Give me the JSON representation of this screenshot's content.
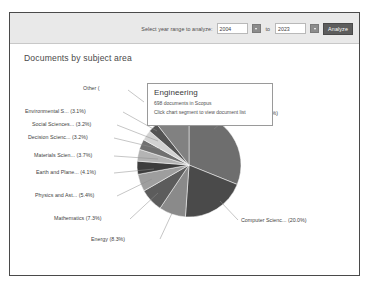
{
  "toolbar": {
    "year_range_label": "Select year range to analyze:",
    "start_year": "2004",
    "end_year": "2023",
    "to_label": "to",
    "analyze_label": "Analyze",
    "start_dropdown_icon": "chevron-down-icon",
    "end_dropdown_icon": "chevron-down-icon"
  },
  "chart_title": "Documents by subject area",
  "tooltip": {
    "title": "Engineering",
    "count_text": "698 documents in Scopus",
    "hint_text": "Click chart segment to view document list"
  },
  "chart_data": {
    "type": "pie",
    "title": "Documents by subject area",
    "legend_position": "none",
    "labels_style": "leader-line callouts",
    "categories": [
      "Engineering (31.1%)",
      "Computer Scienc... (20.0%)",
      "Energy (8.3%)",
      "Mathematics (7.3%)",
      "Physics and Ast... (5.4%)",
      "Earth and Plane... (4.1%)",
      "Materials Scien... (3.7%)",
      "Decision Scienc... (3.2%)",
      "Social Sciences... (3.2%)",
      "Environmental S... (3.1%)",
      "Other (...)"
    ],
    "values": [
      31.1,
      20.0,
      8.3,
      7.3,
      5.4,
      4.1,
      3.7,
      3.2,
      3.2,
      3.1,
      10.6
    ],
    "unit": "%",
    "colors": [
      "#6e6e6e",
      "#4a4a4a",
      "#8a8a8a",
      "#5c5c5c",
      "#9e9e9e",
      "#3d3d3d",
      "#b4b4b4",
      "#707070",
      "#d2d2d2",
      "#545454",
      "#818181"
    ]
  },
  "slice_labels": [
    {
      "text": "Other (",
      "side": "left"
    },
    {
      "text": "Environmental S... (3.1%)",
      "side": "left"
    },
    {
      "text": "Social Sciences... (3.2%)",
      "side": "left"
    },
    {
      "text": "Decision Scienc... (3.2%)",
      "side": "left"
    },
    {
      "text": "Materials Scien... (3.7%)",
      "side": "left"
    },
    {
      "text": "Earth and Plane... (4.1%)",
      "side": "left"
    },
    {
      "text": "Physics and Ast... (5.4%)",
      "side": "left"
    },
    {
      "text": "Mathematics (7.3%)",
      "side": "left"
    },
    {
      "text": "Energy (8.3%)",
      "side": "left"
    },
    {
      "text": "Computer Scienc... (20.0%)",
      "side": "right"
    },
    {
      "text": "ngineering (31.1%)",
      "side": "right"
    }
  ]
}
